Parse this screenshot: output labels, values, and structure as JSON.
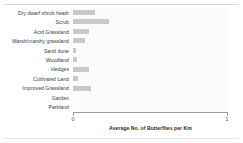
{
  "chart_data": {
    "type": "bar",
    "orientation": "horizontal",
    "title": "",
    "xlabel": "Average No. of Butterflies per Km",
    "ylabel": "",
    "xlim": [
      0,
      1
    ],
    "xticks": [
      "0",
      "1"
    ],
    "grid": false,
    "legend": null,
    "bar_color": "#c9c9c9",
    "categories": [
      "Dry dwarf shrub heath",
      "Scrub",
      "Acid Grassland",
      "Marsh/marshy grassland",
      "Sand dune",
      "Woodland",
      "Hedges",
      "Cultivated Land",
      "Improved Grassland",
      "Garden",
      "Parkland"
    ],
    "values": [
      0.145,
      0.235,
      0.1,
      0.075,
      0.02,
      0.025,
      0.105,
      0.035,
      0.115,
      0.0,
      0.0
    ]
  }
}
